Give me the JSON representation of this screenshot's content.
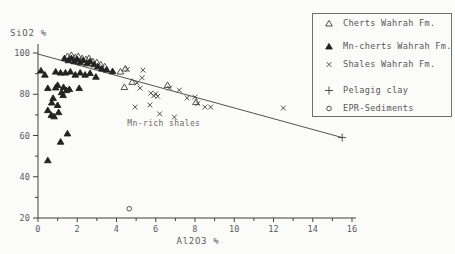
{
  "figure_title": "SiO2 vs Al2O3 scatter diagram",
  "legend": {
    "items": [
      {
        "marker": "open-triangle",
        "label": "Cherts Wahrah Fm."
      },
      {
        "marker": "filled-triangle",
        "label": "Mn-cherts Wahrah Fm."
      },
      {
        "marker": "x-cross",
        "label": "Shales Wahrah Fm."
      },
      {
        "marker": "plus",
        "label": "Pelagig clay"
      },
      {
        "marker": "open-circle",
        "label": "EPR-Sediments"
      }
    ]
  },
  "colors": {
    "ink": "#3f3f3f",
    "marker_fill": "#222222",
    "text": "#5a5a5a",
    "paper": "#fbfbf9"
  },
  "chart_data": {
    "type": "scatter",
    "title": "",
    "xlabel": "Al2O3 %",
    "ylabel": "SiO2 %",
    "xlim": [
      0,
      16
    ],
    "ylim": [
      20,
      100
    ],
    "grid": false,
    "legend_position": "top-right",
    "x_major_ticks": [
      0,
      2,
      4,
      6,
      8,
      10,
      12,
      14,
      16
    ],
    "x_minor_ticks": [
      1,
      3,
      5,
      7,
      9,
      11,
      13,
      15
    ],
    "y_major_ticks": [
      20,
      40,
      60,
      80,
      100
    ],
    "y_minor_ticks": [
      30,
      50,
      70,
      90
    ],
    "annotation": {
      "text": "Mn-rich shales",
      "x": 4.55,
      "y": 64.8
    },
    "trend_line": {
      "x1": 0,
      "y1": 99.5,
      "x2": 15.5,
      "y2": 59
    },
    "series": [
      {
        "name": "Cherts Wahrah Fm.",
        "marker": "open-triangle",
        "points": [
          [
            1.5,
            98.5
          ],
          [
            1.7,
            99
          ],
          [
            1.9,
            98
          ],
          [
            2.05,
            98.5
          ],
          [
            2.25,
            97.5
          ],
          [
            2.45,
            97
          ],
          [
            2.6,
            97.5
          ],
          [
            2.8,
            96
          ],
          [
            3.0,
            95.5
          ],
          [
            3.2,
            94.5
          ],
          [
            3.4,
            93.5
          ],
          [
            4.2,
            91
          ],
          [
            4.45,
            92.5
          ],
          [
            4.8,
            86
          ],
          [
            4.4,
            83.5
          ],
          [
            6.6,
            84.5
          ],
          [
            8.05,
            76.2
          ]
        ]
      },
      {
        "name": "Mn-cherts Wahrah Fm.",
        "marker": "filled-triangle",
        "points": [
          [
            1.35,
            97.5
          ],
          [
            1.55,
            96.5
          ],
          [
            1.7,
            97.5
          ],
          [
            1.85,
            96
          ],
          [
            2.0,
            97
          ],
          [
            2.15,
            95.5
          ],
          [
            2.3,
            96.5
          ],
          [
            2.5,
            95
          ],
          [
            2.65,
            96
          ],
          [
            2.85,
            94.5
          ],
          [
            3.05,
            93.5
          ],
          [
            3.25,
            92.5
          ],
          [
            3.5,
            92
          ],
          [
            3.8,
            91.2
          ],
          [
            0.15,
            91.5
          ],
          [
            0.35,
            89.5
          ],
          [
            0.9,
            91
          ],
          [
            1.15,
            90.5
          ],
          [
            1.4,
            90.5
          ],
          [
            1.65,
            91
          ],
          [
            1.9,
            89.5
          ],
          [
            2.15,
            90.5
          ],
          [
            2.4,
            89.5
          ],
          [
            2.65,
            90.3
          ],
          [
            2.95,
            88.5
          ],
          [
            1.0,
            84.5
          ],
          [
            1.3,
            83.5
          ],
          [
            0.5,
            83
          ],
          [
            0.9,
            83.3
          ],
          [
            1.2,
            81
          ],
          [
            1.45,
            82
          ],
          [
            1.6,
            82.5
          ],
          [
            2.1,
            83
          ],
          [
            0.77,
            78.2
          ],
          [
            1.28,
            79.6
          ],
          [
            0.7,
            76
          ],
          [
            1.0,
            74.8
          ],
          [
            0.5,
            72.3
          ],
          [
            0.68,
            70
          ],
          [
            0.82,
            69.3
          ],
          [
            1.05,
            71.3
          ],
          [
            1.5,
            61
          ],
          [
            1.15,
            57
          ],
          [
            0.5,
            48
          ]
        ]
      },
      {
        "name": "Shales Wahrah Fm.",
        "marker": "x-cross",
        "points": [
          [
            4.55,
            92
          ],
          [
            5.35,
            91.7
          ],
          [
            5.3,
            88
          ],
          [
            5.05,
            85.5
          ],
          [
            5.2,
            83
          ],
          [
            5.75,
            80.5
          ],
          [
            5.9,
            79.3
          ],
          [
            6.0,
            80.2
          ],
          [
            6.1,
            79
          ],
          [
            5.7,
            74.8
          ],
          [
            4.95,
            73.8
          ],
          [
            6.7,
            83
          ],
          [
            7.2,
            82
          ],
          [
            7.6,
            78.2
          ],
          [
            8.0,
            78.6
          ],
          [
            8.15,
            75.5
          ],
          [
            8.5,
            73.8
          ],
          [
            8.8,
            73.8
          ],
          [
            6.2,
            70.5
          ],
          [
            6.95,
            68.9
          ],
          [
            12.5,
            73.3
          ]
        ]
      },
      {
        "name": "Pelagig clay",
        "marker": "plus",
        "points": [
          [
            15.5,
            59
          ]
        ]
      },
      {
        "name": "EPR-Sediments",
        "marker": "open-circle",
        "points": [
          [
            4.65,
            24.5
          ]
        ]
      }
    ]
  }
}
